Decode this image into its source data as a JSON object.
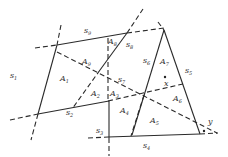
{
  "diagram": {
    "type": "geometric-arrangement",
    "segment_labels": [
      {
        "id": "s1",
        "text": "s",
        "sub": "1",
        "x": 10,
        "y": 78
      },
      {
        "id": "s2",
        "text": "s",
        "sub": "2",
        "x": 66,
        "y": 115
      },
      {
        "id": "s3",
        "text": "s",
        "sub": "3",
        "x": 96,
        "y": 133
      },
      {
        "id": "s4",
        "text": "s",
        "sub": "4",
        "x": 143,
        "y": 148
      },
      {
        "id": "s5",
        "text": "s",
        "sub": "5",
        "x": 185,
        "y": 73
      },
      {
        "id": "s6",
        "text": "s",
        "sub": "6",
        "x": 143,
        "y": 63
      },
      {
        "id": "s7",
        "text": "s",
        "sub": "7",
        "x": 118,
        "y": 82
      },
      {
        "id": "s8",
        "text": "s",
        "sub": "8",
        "x": 126,
        "y": 47
      },
      {
        "id": "s9",
        "text": "s",
        "sub": "9",
        "x": 84,
        "y": 33
      }
    ],
    "region_labels": [
      {
        "id": "A1",
        "text": "A",
        "sub": "1",
        "x": 60,
        "y": 81
      },
      {
        "id": "A2",
        "text": "A",
        "sub": "2",
        "x": 91,
        "y": 96
      },
      {
        "id": "A3",
        "text": "A",
        "sub": "3",
        "x": 110,
        "y": 96
      },
      {
        "id": "A4",
        "text": "A",
        "sub": "4",
        "x": 120,
        "y": 113
      },
      {
        "id": "A5",
        "text": "A",
        "sub": "5",
        "x": 150,
        "y": 123
      },
      {
        "id": "A6",
        "text": "A",
        "sub": "6",
        "x": 173,
        "y": 101
      },
      {
        "id": "A7",
        "text": "A",
        "sub": "7",
        "x": 160,
        "y": 64
      },
      {
        "id": "A8",
        "text": "A",
        "sub": "8",
        "x": 108,
        "y": 44
      },
      {
        "id": "A9",
        "text": "A",
        "sub": "9",
        "x": 82,
        "y": 64
      }
    ],
    "point_labels": [
      {
        "id": "x",
        "text": "x",
        "x": 164,
        "y": 86,
        "dot": [
          165,
          77
        ]
      },
      {
        "id": "y",
        "text": "y",
        "x": 208,
        "y": 124,
        "dot": [
          204,
          131
        ]
      }
    ]
  }
}
